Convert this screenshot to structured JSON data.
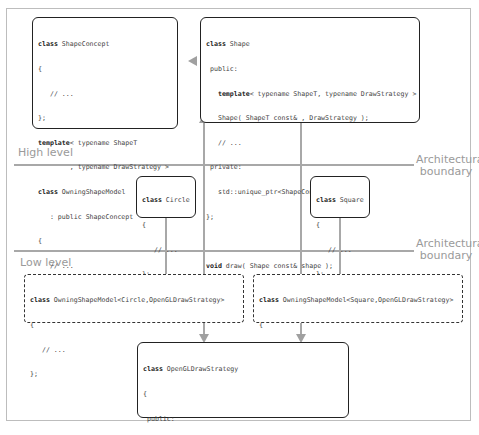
{
  "labels": {
    "high_level": "High level",
    "low_level": "Low level",
    "boundary_top_1": "Architectural",
    "boundary_top_2": "boundary",
    "boundary_bottom_1": "Architectural",
    "boundary_bottom_2": "boundary"
  },
  "boxes": {
    "shape_concept": {
      "lines": [
        {
          "kw": "class",
          "rest": " ShapeConcept"
        },
        {
          "kw": "",
          "rest": "{"
        },
        {
          "kw": "",
          "rest": "   // ..."
        },
        {
          "kw": "",
          "rest": "};"
        },
        {
          "kw": "template",
          "rest": "< typename ShapeT"
        },
        {
          "kw": "",
          "rest": "        , typename DrawStrategy >"
        },
        {
          "kw": "class",
          "rest": " OwningShapeModel"
        },
        {
          "kw": "",
          "rest": "   : public ShapeConcept"
        },
        {
          "kw": "",
          "rest": "{"
        },
        {
          "kw": "",
          "rest": "   // ..."
        },
        {
          "kw": "",
          "rest": "};"
        }
      ]
    },
    "shape": {
      "lines": [
        {
          "kw": "class",
          "rest": " Shape"
        },
        {
          "kw": "",
          "rest": " public:"
        },
        {
          "kw": "   template",
          "rest": "< typename ShapeT, typename DrawStrategy >"
        },
        {
          "kw": "",
          "rest": "   Shape( ShapeT const& , DrawStrategy );"
        },
        {
          "kw": "",
          "rest": "   // ..."
        },
        {
          "kw": "",
          "rest": " private:"
        },
        {
          "kw": "",
          "rest": "   std::unique_ptr<ShapeConcept> pimpl_;"
        },
        {
          "kw": "",
          "rest": "};"
        },
        {
          "kw": "",
          "rest": ""
        },
        {
          "kw": "void",
          "rest": " draw( Shape const& shape );"
        }
      ]
    },
    "circle": {
      "lines": [
        {
          "kw": "class",
          "rest": " Circle"
        },
        {
          "kw": "",
          "rest": "{"
        },
        {
          "kw": "",
          "rest": "   // ..."
        },
        {
          "kw": "",
          "rest": "};"
        }
      ]
    },
    "square": {
      "lines": [
        {
          "kw": "class",
          "rest": " Square"
        },
        {
          "kw": "",
          "rest": "{"
        },
        {
          "kw": "",
          "rest": "   // ..."
        },
        {
          "kw": "",
          "rest": "};"
        }
      ]
    },
    "model_circle": {
      "lines": [
        {
          "kw": "class",
          "rest": " OwningShapeModel<Circle,OpenGLDrawStrategy>"
        },
        {
          "kw": "",
          "rest": "{"
        },
        {
          "kw": "",
          "rest": "   // ..."
        },
        {
          "kw": "",
          "rest": "};"
        }
      ]
    },
    "model_square": {
      "lines": [
        {
          "kw": "class",
          "rest": " OwningShapeModel<Square,OpenGLDrawStrategy>"
        },
        {
          "kw": "",
          "rest": "{"
        },
        {
          "kw": "",
          "rest": "   // ..."
        },
        {
          "kw": "",
          "rest": "};"
        }
      ]
    },
    "opengl_strategy": {
      "lines": [
        {
          "kw": "class",
          "rest": " OpenGLDrawStrategy"
        },
        {
          "kw": "",
          "rest": "{"
        },
        {
          "kw": "",
          "rest": " public:"
        },
        {
          "kw": "   void operator",
          "rest": "()( Circle const& circle ) const;"
        },
        {
          "kw": "   void operator",
          "rest": "()( Square const& square ) const;"
        },
        {
          "kw": "",
          "rest": "   // ..."
        },
        {
          "kw": "",
          "rest": "};"
        }
      ]
    }
  },
  "colors": {
    "line": "#a8a8a8",
    "arrow": "#a0a0a0",
    "box_border": "#222222",
    "label": "#9a9a9a"
  }
}
